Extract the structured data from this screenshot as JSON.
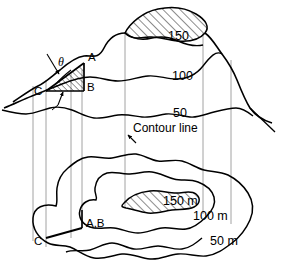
{
  "figure": {
    "title_alt": "Block diagram and contour map showing apparent dip angle theta",
    "stroke_color": "#000000",
    "projection_line_color": "#8a8a8a",
    "background": "#ffffff",
    "hatch_color": "#000000"
  },
  "block_view": {
    "contour_labels": [
      {
        "id": "block-150",
        "text": "150",
        "x": 168,
        "y": 36
      },
      {
        "id": "block-100",
        "text": "100",
        "x": 172,
        "y": 76
      },
      {
        "id": "block-50",
        "text": "50",
        "x": 173,
        "y": 113
      }
    ],
    "points": [
      {
        "id": "point-a",
        "text": "A",
        "x": 88,
        "y": 58
      },
      {
        "id": "point-b",
        "text": "B",
        "x": 87,
        "y": 88
      },
      {
        "id": "point-c",
        "text": "C",
        "x": 40,
        "y": 92
      }
    ],
    "angle": {
      "id": "angle-theta",
      "text": "θ",
      "x": 60,
      "y": 62
    }
  },
  "map_view": {
    "annotation": {
      "id": "contour-line-note",
      "text": "Contour line",
      "x": 133,
      "y": 130
    },
    "contour_labels": [
      {
        "id": "map-150m",
        "text": "150 m",
        "x": 165,
        "y": 201
      },
      {
        "id": "map-100m",
        "text": "100 m",
        "x": 196,
        "y": 216
      },
      {
        "id": "map-50m",
        "text": "50 m",
        "x": 212,
        "y": 241
      }
    ],
    "points": [
      {
        "id": "point-ab-map",
        "text": "A,B",
        "x": 86,
        "y": 224
      },
      {
        "id": "point-c-map",
        "text": "C",
        "x": 38,
        "y": 240
      }
    ]
  },
  "legend": {
    "elevation_units": "m",
    "contour_interval": 50,
    "elevations": [
      50,
      100,
      150
    ]
  }
}
